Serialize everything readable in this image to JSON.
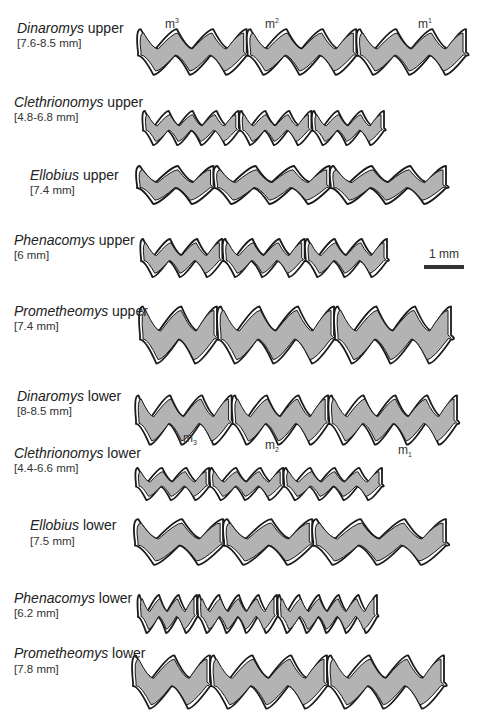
{
  "figure": {
    "rows": [
      {
        "id": "dinaromys-upper",
        "genus": "Dinaromys",
        "jaw": "upper",
        "range": "[7.6-8.5 mm]",
        "label_x": 17,
        "label_y": 20,
        "range_x": 17,
        "range_y": 37,
        "x0": 138,
        "x1": 467,
        "yc": 52,
        "amp": 24,
        "teeth": 3,
        "waves": [
          3,
          3,
          3
        ]
      },
      {
        "id": "clethrionomys-upper",
        "genus": "Clethrionomys",
        "jaw": "upper",
        "range": "[4.8-6.8 mm]",
        "label_x": 14,
        "label_y": 94,
        "range_x": 14,
        "range_y": 111,
        "x0": 143,
        "x1": 385,
        "yc": 128,
        "amp": 18,
        "teeth": 3,
        "waves": [
          4,
          3,
          3
        ]
      },
      {
        "id": "ellobius-upper",
        "genus": "Ellobius",
        "jaw": "upper",
        "range": "[7.4 mm]",
        "label_x": 30,
        "label_y": 167,
        "range_x": 30,
        "range_y": 184,
        "x0": 137,
        "x1": 447,
        "yc": 185,
        "amp": 20,
        "teeth": 3,
        "waves": [
          2,
          3,
          3
        ]
      },
      {
        "id": "phenacomys-upper",
        "genus": "Phenacomys",
        "jaw": "upper",
        "range": "[6 mm]",
        "label_x": 14,
        "label_y": 232,
        "range_x": 14,
        "range_y": 249,
        "x0": 141,
        "x1": 388,
        "yc": 258,
        "amp": 20,
        "teeth": 3,
        "waves": [
          3,
          3,
          3
        ]
      },
      {
        "id": "prometheomys-upper",
        "genus": "Prometheomys",
        "jaw": "upper",
        "range": "[7.4 mm]",
        "label_x": 14,
        "label_y": 303,
        "range_x": 14,
        "range_y": 320,
        "x0": 140,
        "x1": 452,
        "yc": 335,
        "amp": 30,
        "teeth": 3,
        "waves": [
          2,
          3,
          3
        ]
      },
      {
        "id": "dinaromys-lower",
        "genus": "Dinaromys",
        "jaw": "lower",
        "range": "[8-8.5 mm]",
        "label_x": 17,
        "label_y": 388,
        "range_x": 17,
        "range_y": 405,
        "x0": 136,
        "x1": 458,
        "yc": 420,
        "amp": 26,
        "teeth": 3,
        "waves": [
          3,
          3,
          4
        ]
      },
      {
        "id": "clethrionomys-lower",
        "genus": "Clethrionomys",
        "jaw": "lower",
        "range": "[4.4-6.6 mm]",
        "label_x": 14,
        "label_y": 445,
        "range_x": 14,
        "range_y": 462,
        "x0": 136,
        "x1": 383,
        "yc": 484,
        "amp": 17,
        "teeth": 3,
        "waves": [
          3,
          3,
          4
        ]
      },
      {
        "id": "ellobius-lower",
        "genus": "Ellobius",
        "jaw": "lower",
        "range": "[7.5 mm]",
        "label_x": 30,
        "label_y": 517,
        "range_x": 30,
        "range_y": 535,
        "x0": 135,
        "x1": 447,
        "yc": 542,
        "amp": 24,
        "teeth": 3,
        "waves": [
          2,
          2,
          3
        ]
      },
      {
        "id": "phenacomys-lower",
        "genus": "Phenacomys",
        "jaw": "lower",
        "range": "[6.2 mm]",
        "label_x": 14,
        "label_y": 590,
        "range_x": 14,
        "range_y": 607,
        "x0": 138,
        "x1": 378,
        "yc": 614,
        "amp": 20,
        "teeth": 3,
        "waves": [
          3,
          4,
          5
        ]
      },
      {
        "id": "prometheomys-lower",
        "genus": "Prometheomys",
        "jaw": "lower",
        "range": "[7.8 mm]",
        "label_x": 14,
        "label_y": 645,
        "range_x": 14,
        "range_y": 663,
        "x0": 133,
        "x1": 445,
        "yc": 682,
        "amp": 28,
        "teeth": 3,
        "waves": [
          2,
          3,
          3
        ]
      }
    ],
    "tooth_labels": {
      "upper": [
        {
          "base": "m",
          "index": "3",
          "x": 165,
          "y": 17
        },
        {
          "base": "m",
          "index": "2",
          "x": 265,
          "y": 17
        },
        {
          "base": "m",
          "index": "1",
          "x": 418,
          "y": 17
        }
      ],
      "lower": [
        {
          "base": "m",
          "index": "3",
          "x": 183,
          "y": 431
        },
        {
          "base": "m",
          "index": "2",
          "x": 265,
          "y": 438
        },
        {
          "base": "m",
          "index": "1",
          "x": 398,
          "y": 443
        }
      ]
    },
    "scale_bar": {
      "text": "1 mm",
      "text_x": 429,
      "text_y": 247,
      "bar_x": 424,
      "bar_y": 265,
      "bar_w": 40
    },
    "colors": {
      "dentine": "#b3b3b3",
      "enamel": "#ffffff",
      "outline": "#1a1a1a"
    },
    "upper_word": "upper",
    "lower_word": "lower"
  }
}
